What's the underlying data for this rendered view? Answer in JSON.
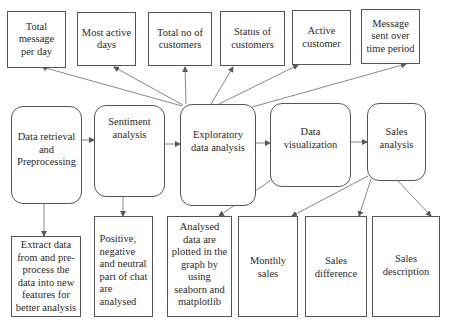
{
  "diagram": {
    "type": "flowchart",
    "line_color": "#5a5a5a",
    "top_row": [
      {
        "id": "total-message-per-day",
        "label": "Total\nmessage\nper day"
      },
      {
        "id": "most-active-days",
        "label": "Most active\ndays"
      },
      {
        "id": "total-no-of-customers",
        "label": "Total no of\ncustomers"
      },
      {
        "id": "status-of-customers",
        "label": "Status of\ncustomers"
      },
      {
        "id": "active-customer",
        "label": "Active\ncustomer"
      },
      {
        "id": "message-sent-over-time",
        "label": "Message\nsent over\ntime period"
      }
    ],
    "process_row": [
      {
        "id": "data-retrieval",
        "label": "Data retrieval\nand\nPreprocessing"
      },
      {
        "id": "sentiment-analysis",
        "label": "Sentiment\nanalysis"
      },
      {
        "id": "exploratory-data-analysis",
        "label": "Exploratory\ndata analysis"
      },
      {
        "id": "data-visualization",
        "label": "Data\nvisualization"
      },
      {
        "id": "sales-analysis",
        "label": "Sales\nanalysis"
      }
    ],
    "bottom_row": [
      {
        "id": "extract-data",
        "label": "Extract data\nfrom and pre-\nprocess the\ndata into new\nfeatures for\nbetter analysis"
      },
      {
        "id": "sentiment-result",
        "label": "Positive,\nnegative\nand neutral\npart of chat\nare\nanalysed"
      },
      {
        "id": "analysed-plotted",
        "label": "Analysed\ndata are\nplotted in the\ngraph by\nusing\nseaborn and\nmatplotlib"
      },
      {
        "id": "monthly-sales",
        "label": "Monthly\nsales"
      },
      {
        "id": "sales-difference",
        "label": "Sales\ndifference"
      },
      {
        "id": "sales-description",
        "label": "Sales\ndescription"
      }
    ],
    "edges": [
      {
        "from": "data-retrieval",
        "to": "sentiment-analysis"
      },
      {
        "from": "sentiment-analysis",
        "to": "exploratory-data-analysis"
      },
      {
        "from": "exploratory-data-analysis",
        "to": "data-visualization"
      },
      {
        "from": "data-visualization",
        "to": "sales-analysis"
      },
      {
        "from": "exploratory-data-analysis",
        "to": "total-message-per-day"
      },
      {
        "from": "exploratory-data-analysis",
        "to": "most-active-days"
      },
      {
        "from": "exploratory-data-analysis",
        "to": "total-no-of-customers"
      },
      {
        "from": "exploratory-data-analysis",
        "to": "status-of-customers"
      },
      {
        "from": "exploratory-data-analysis",
        "to": "active-customer"
      },
      {
        "from": "exploratory-data-analysis",
        "to": "message-sent-over-time"
      },
      {
        "from": "data-retrieval",
        "to": "extract-data"
      },
      {
        "from": "sentiment-analysis",
        "to": "sentiment-result"
      },
      {
        "from": "data-visualization",
        "to": "analysed-plotted"
      },
      {
        "from": "sales-analysis",
        "to": "monthly-sales"
      },
      {
        "from": "sales-analysis",
        "to": "sales-difference"
      },
      {
        "from": "sales-analysis",
        "to": "sales-description"
      }
    ]
  }
}
